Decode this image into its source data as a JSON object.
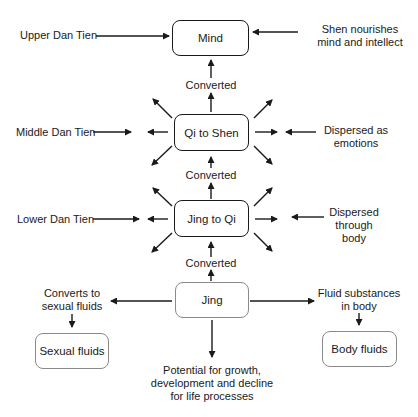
{
  "diagram": {
    "type": "flowchart",
    "nodes": {
      "mind": "Mind",
      "qi_to_shen": "Qi to Shen",
      "jing_to_qi": "Jing to Qi",
      "jing": "Jing",
      "sexual_fluids": "Sexual fluids",
      "body_fluids": "Body fluids"
    },
    "labels": {
      "upper_dan_tien": "Upper Dan Tien",
      "middle_dan_tien": "Middle Dan Tien",
      "lower_dan_tien": "Lower Dan Tien",
      "shen_nourishes": [
        "Shen nourishes",
        "mind and intellect"
      ],
      "dispersed_emotions": [
        "Dispersed as",
        "emotions"
      ],
      "dispersed_body": [
        "Dispersed",
        "through",
        "body"
      ],
      "converted_1": "Converted",
      "converted_2": "Converted",
      "converted_3": "Converted",
      "converts_sexual": [
        "Converts to",
        "sexual fluids"
      ],
      "fluid_substances": [
        "Fluid substances",
        "in body"
      ],
      "potential": [
        "Potential for growth,",
        "development and decline",
        "for life processes"
      ]
    },
    "edges": [
      {
        "from": "Upper Dan Tien",
        "to": "Mind"
      },
      {
        "from": "Shen nourishes mind and intellect",
        "to": "Mind"
      },
      {
        "from": "Qi to Shen",
        "to": "Mind",
        "label": "Converted"
      },
      {
        "from": "Middle Dan Tien",
        "to": "Qi to Shen"
      },
      {
        "from": "Dispersed as emotions",
        "to": "Qi to Shen"
      },
      {
        "from": "Jing to Qi",
        "to": "Qi to Shen",
        "label": "Converted"
      },
      {
        "from": "Lower Dan Tien",
        "to": "Jing to Qi"
      },
      {
        "from": "Dispersed through body",
        "to": "Jing to Qi"
      },
      {
        "from": "Jing",
        "to": "Jing to Qi",
        "label": "Converted"
      },
      {
        "from": "Jing",
        "to": "Converts to sexual fluids"
      },
      {
        "from": "Converts to sexual fluids",
        "to": "Sexual fluids"
      },
      {
        "from": "Jing",
        "to": "Fluid substances in body"
      },
      {
        "from": "Fluid substances in body",
        "to": "Body fluids"
      },
      {
        "from": "Jing",
        "to": "Potential for growth, development and decline for life processes"
      }
    ],
    "colors": {
      "stroke": "#1a1a1a",
      "light_stroke": "#8a8a8a",
      "background": "#ffffff"
    }
  }
}
